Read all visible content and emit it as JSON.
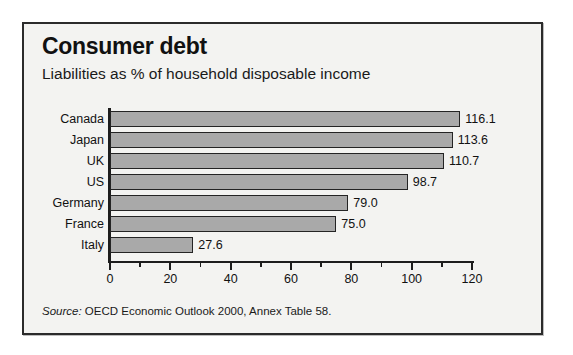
{
  "figure": {
    "title": "Consumer debt",
    "subtitle": "Liabilities as % of household disposable income",
    "source_label": "Source:",
    "source_text": " OECD Economic Outlook 2000, Annex Table 58."
  },
  "colors": {
    "bar_fill": "#a9a9a9",
    "bar_outline": "#242424",
    "panel_background": "#f3f3f1",
    "panel_border": "#2b2b2b",
    "text": "#111111"
  },
  "chart_data": {
    "type": "bar",
    "orientation": "horizontal",
    "title": "Consumer debt",
    "subtitle": "Liabilities as % of household disposable income",
    "xlabel": "",
    "ylabel": "",
    "xlim": [
      0,
      120
    ],
    "grid": false,
    "legend": "none",
    "xticks": [
      0,
      20,
      40,
      60,
      80,
      100,
      120
    ],
    "xtick_labels": [
      "0",
      "20",
      "40",
      "60",
      "80",
      "100",
      "120"
    ],
    "minor_tick_interval": 10,
    "categories": [
      "Canada",
      "Japan",
      "UK",
      "US",
      "Germany",
      "France",
      "Italy"
    ],
    "values": [
      116.1,
      113.6,
      110.7,
      98.7,
      79.0,
      75.0,
      27.6
    ],
    "value_labels": [
      "116.1",
      "113.6",
      "110.7",
      "98.7",
      "79.0",
      "75.0",
      "27.6"
    ],
    "source": "Source: OECD Economic Outlook 2000, Annex Table 58."
  }
}
